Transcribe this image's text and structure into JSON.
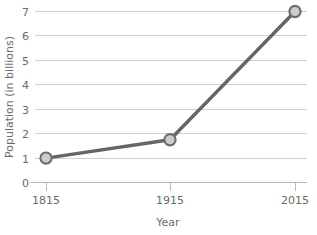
{
  "chart_data": {
    "type": "line",
    "title": "",
    "xlabel": "Year",
    "ylabel": "Population (in billions)",
    "x": [
      "1815",
      "1915",
      "2015"
    ],
    "categories": [
      "1815",
      "1915",
      "2015"
    ],
    "values": [
      1.0,
      1.75,
      7.0
    ],
    "series": [
      {
        "name": "Population",
        "values": [
          1.0,
          1.75,
          7.0
        ]
      }
    ],
    "xtick_labels": [
      "1815",
      "1915",
      "2015"
    ],
    "ytick_labels": [
      "0",
      "1",
      "2",
      "3",
      "4",
      "5",
      "6",
      "7"
    ],
    "ytick_values": [
      0,
      1,
      2,
      3,
      4,
      5,
      6,
      7
    ],
    "ylim": [
      0,
      7.3
    ],
    "grid": "horizontal",
    "legend": "none",
    "annotations": [],
    "colors": {
      "line": "#666666",
      "marker_fill": "#cccccc",
      "marker_edge": "#6e6e6e",
      "gridline": "#cfcfcf",
      "axis": "#b8b8b8",
      "text": "#6b6b6b",
      "background": "#ffffff"
    },
    "marker": "circle"
  }
}
